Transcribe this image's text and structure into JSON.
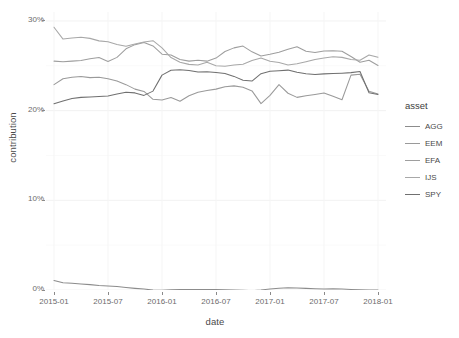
{
  "chart_data": {
    "type": "line",
    "title": "",
    "xlabel": "date",
    "ylabel": "contribution",
    "grid": true,
    "legend_position": "right",
    "legend_title": "asset",
    "ylim": [
      0,
      0.31
    ],
    "ytick_labels": [
      "0%",
      "10%",
      "20%",
      "30%"
    ],
    "ytick_values": [
      0,
      0.1,
      0.2,
      0.3
    ],
    "xtick_labels": [
      "2015-01",
      "2015-07",
      "2016-01",
      "2016-07",
      "2017-01",
      "2017-07",
      "2018-01"
    ],
    "xtick_values": [
      "2015-01",
      "2015-07",
      "2016-01",
      "2016-07",
      "2017-01",
      "2017-07",
      "2018-01"
    ],
    "x": [
      "2015-01",
      "2015-02",
      "2015-03",
      "2015-04",
      "2015-05",
      "2015-06",
      "2015-07",
      "2015-08",
      "2015-09",
      "2015-10",
      "2015-11",
      "2015-12",
      "2016-01",
      "2016-02",
      "2016-03",
      "2016-04",
      "2016-05",
      "2016-06",
      "2016-07",
      "2016-08",
      "2016-09",
      "2016-10",
      "2016-11",
      "2016-12",
      "2017-01",
      "2017-02",
      "2017-03",
      "2017-04",
      "2017-05",
      "2017-06",
      "2017-07",
      "2017-08",
      "2017-09",
      "2017-10",
      "2017-11",
      "2017-12",
      "2018-01"
    ],
    "series": [
      {
        "name": "AGG",
        "color": "#8c8c8c",
        "values": [
          0.0105,
          0.0082,
          0.0075,
          0.0068,
          0.006,
          0.005,
          0.0044,
          0.0038,
          0.0028,
          0.0018,
          0.001,
          0.0,
          -0.0004,
          0.0002,
          0.0004,
          0.0006,
          0.0004,
          0.0006,
          0.0004,
          0.0002,
          0.0,
          -0.0002,
          -0.0008,
          0.0,
          0.0012,
          0.002,
          0.0024,
          0.0022,
          0.0018,
          0.0014,
          0.0012,
          0.0014,
          0.001,
          0.0006,
          0.0002,
          0.0,
          0.0
        ]
      },
      {
        "name": "EEM",
        "color": "#9a9a9a",
        "values": [
          0.229,
          0.2355,
          0.2372,
          0.238,
          0.2368,
          0.2372,
          0.2355,
          0.233,
          0.229,
          0.224,
          0.2214,
          0.2126,
          0.2118,
          0.2146,
          0.2104,
          0.2166,
          0.2206,
          0.2224,
          0.224,
          0.2266,
          0.2276,
          0.226,
          0.222,
          0.2078,
          0.217,
          0.229,
          0.2194,
          0.2148,
          0.2166,
          0.218,
          0.2196,
          0.216,
          0.2122,
          0.2396,
          0.2406,
          0.2216,
          0.2186
        ]
      },
      {
        "name": "EFA",
        "color": "#9e9e9e",
        "values": [
          0.2552,
          0.2546,
          0.2552,
          0.256,
          0.2578,
          0.2592,
          0.2548,
          0.2594,
          0.269,
          0.2736,
          0.276,
          0.2722,
          0.263,
          0.262,
          0.257,
          0.2552,
          0.2562,
          0.2552,
          0.2586,
          0.266,
          0.27,
          0.272,
          0.2656,
          0.261,
          0.2628,
          0.265,
          0.2684,
          0.2712,
          0.2662,
          0.2648,
          0.2666,
          0.2668,
          0.2662,
          0.2604,
          0.254,
          0.2562,
          0.2504
        ]
      },
      {
        "name": "IJS",
        "color": "#a8a8a8",
        "values": [
          0.293,
          0.2798,
          0.281,
          0.2818,
          0.2806,
          0.2778,
          0.2768,
          0.2738,
          0.2718,
          0.2742,
          0.2766,
          0.278,
          0.27,
          0.2592,
          0.254,
          0.2516,
          0.2508,
          0.254,
          0.25,
          0.2496,
          0.2508,
          0.2518,
          0.256,
          0.2588,
          0.255,
          0.2538,
          0.251,
          0.2524,
          0.2546,
          0.257,
          0.2586,
          0.26,
          0.2594,
          0.257,
          0.2562,
          0.262,
          0.2596
        ]
      },
      {
        "name": "SPY",
        "color": "#707070",
        "values": [
          0.2076,
          0.2108,
          0.2136,
          0.2148,
          0.2152,
          0.2158,
          0.2164,
          0.2186,
          0.2206,
          0.2198,
          0.217,
          0.2218,
          0.2396,
          0.245,
          0.2456,
          0.2448,
          0.243,
          0.2434,
          0.2426,
          0.2414,
          0.2382,
          0.234,
          0.233,
          0.2412,
          0.244,
          0.2446,
          0.2452,
          0.2428,
          0.2412,
          0.2404,
          0.241,
          0.2414,
          0.2418,
          0.2424,
          0.2436,
          0.22,
          0.218
        ]
      }
    ]
  },
  "legend": {
    "title": "asset",
    "items": [
      {
        "label": "AGG"
      },
      {
        "label": "EEM"
      },
      {
        "label": "EFA"
      },
      {
        "label": "IJS"
      },
      {
        "label": "SPY"
      }
    ]
  },
  "axes": {
    "x_title": "date",
    "y_title": "contribution"
  }
}
